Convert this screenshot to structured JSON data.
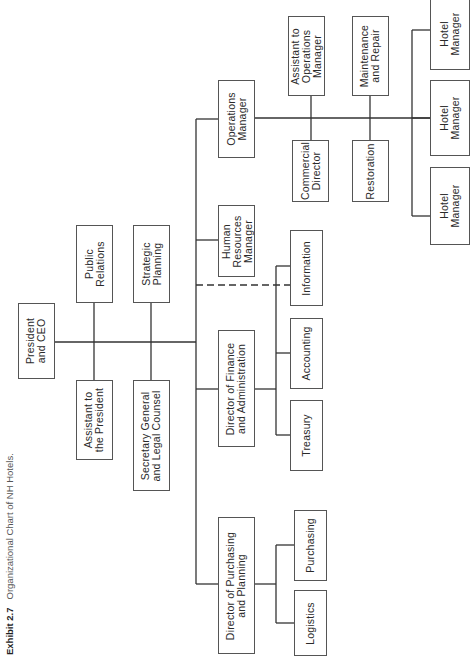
{
  "caption": {
    "exhibit": "Exhibit 2.7",
    "title": "Organizational Chart of NH Hotels."
  },
  "boxes": {
    "president": "President\nand CEO",
    "public_relations": "Public\nRelations",
    "assistant_president": "Assistant to\nthe President",
    "strategic_planning": "Strategic\nPlanning",
    "secretary_general": "Secretary General\nand Legal Counsel",
    "operations_manager": "Operations\nManager",
    "human_resources": "Human\nResources\nManager",
    "director_finance": "Director of Finance\nand Administration",
    "director_purchasing": "Director of Purchasing\nand Planning",
    "information": "Information",
    "accounting": "Accounting",
    "treasury": "Treasury",
    "purchasing": "Purchasing",
    "logistics": "Logistics",
    "assistant_operations": "Assistant to\nOperations\nManager",
    "commercial_director": "Commercial\nDirector",
    "maintenance_repair": "Maintenance\nand Repair",
    "restoration": "Restoration",
    "hotel_manager_1": "Hotel\nManager",
    "hotel_manager_2": "Hotel\nManager",
    "hotel_manager_3": "Hotel\nManager"
  },
  "colors": {
    "line": "#333333",
    "box_border": "#555555",
    "text": "#2a2a2a"
  }
}
